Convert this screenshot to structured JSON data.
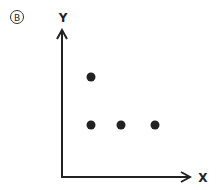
{
  "panel_label": "Ⓑ",
  "axes": {
    "x_label": "X",
    "y_label": "Y"
  },
  "colors": {
    "ink": "#222222",
    "background": "#ffffff"
  },
  "chart_data": {
    "type": "scatter",
    "title": "",
    "xlabel": "X",
    "ylabel": "Y",
    "points": [
      {
        "x": 1,
        "y": 2
      },
      {
        "x": 1,
        "y": 1
      },
      {
        "x": 2,
        "y": 1
      },
      {
        "x": 3,
        "y": 1
      }
    ],
    "grid": false,
    "ticks": "none"
  }
}
